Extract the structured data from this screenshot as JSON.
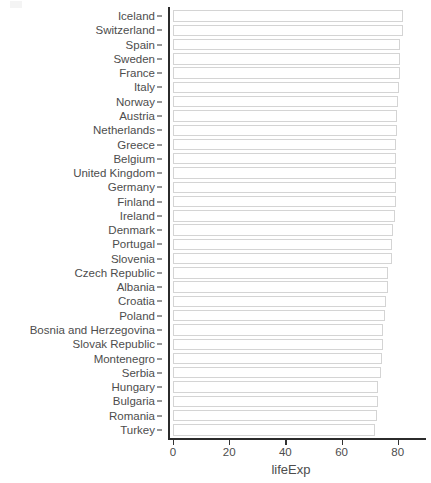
{
  "chart_data": {
    "type": "bar",
    "orientation": "horizontal",
    "title": "",
    "xlabel": "lifeExp",
    "ylabel": "fct_reorder(country, lifeExp)",
    "xlim": [
      0,
      84
    ],
    "xticks": [
      0,
      20,
      40,
      60,
      80
    ],
    "xtick_labels": [
      "0",
      "20",
      "40",
      "60",
      "80"
    ],
    "grid": false,
    "legend": "none",
    "bar_fill": "#ffffff",
    "bar_outline": "#d4d4d4",
    "axis_color": "#2b2b2b",
    "text_color": "#4d4d4d",
    "categories": [
      "Iceland",
      "Switzerland",
      "Spain",
      "Sweden",
      "France",
      "Italy",
      "Norway",
      "Austria",
      "Netherlands",
      "Greece",
      "Belgium",
      "United Kingdom",
      "Germany",
      "Finland",
      "Ireland",
      "Denmark",
      "Portugal",
      "Slovenia",
      "Czech Republic",
      "Albania",
      "Croatia",
      "Poland",
      "Bosnia and Herzegovina",
      "Slovak Republic",
      "Montenegro",
      "Serbia",
      "Hungary",
      "Bulgaria",
      "Romania",
      "Turkey"
    ],
    "values": [
      81.8,
      81.7,
      80.9,
      80.9,
      80.7,
      80.5,
      80.2,
      79.8,
      79.8,
      79.5,
      79.4,
      79.4,
      79.4,
      79.3,
      78.9,
      78.3,
      78.1,
      77.9,
      76.5,
      76.4,
      75.7,
      75.6,
      74.9,
      74.7,
      74.5,
      74.0,
      73.0,
      73.0,
      72.5,
      71.8
    ]
  }
}
